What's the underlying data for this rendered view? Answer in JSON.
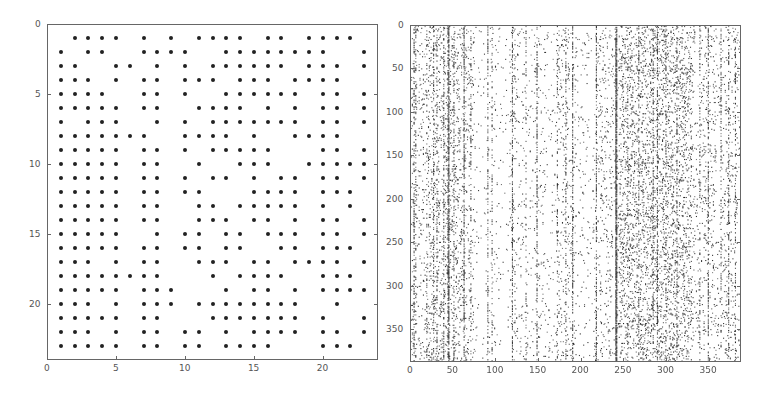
{
  "chart_data": [
    {
      "type": "scatter",
      "subtype": "spy / sparsity pattern",
      "title": "",
      "xlabel": "",
      "ylabel": "",
      "xlim": [
        0,
        24
      ],
      "ylim": [
        24,
        0
      ],
      "y_reversed": true,
      "grid": false,
      "x_ticks": [
        0,
        5,
        10,
        15,
        20
      ],
      "y_ticks": [
        0,
        5,
        10,
        15,
        20
      ],
      "marker": "dot",
      "rows": {
        "1": [
          2,
          3,
          4,
          5,
          7,
          9,
          11,
          12,
          13,
          14,
          16,
          17,
          19,
          20,
          21,
          22
        ],
        "2": [
          1,
          3,
          4,
          7,
          8,
          9,
          10,
          13,
          14,
          15,
          16,
          17,
          18,
          19,
          20,
          23
        ],
        "3": [
          1,
          2,
          5,
          6,
          8,
          10,
          12,
          13,
          14,
          15,
          16,
          17,
          19,
          20,
          21,
          23
        ],
        "4": [
          1,
          2,
          3,
          5,
          7,
          8,
          10,
          11,
          12,
          14,
          15,
          16,
          18,
          19,
          20,
          21
        ],
        "5": [
          1,
          2,
          3,
          4,
          7,
          8,
          10,
          13,
          14,
          15,
          16,
          17,
          18,
          20,
          21,
          23
        ],
        "6": [
          1,
          2,
          3,
          4,
          5,
          7,
          8,
          11,
          12,
          13,
          14,
          16,
          18,
          20,
          21,
          23
        ],
        "7": [
          1,
          3,
          4,
          5,
          8,
          10,
          12,
          13,
          14,
          15,
          16,
          17,
          18,
          20,
          21,
          23
        ],
        "8": [
          1,
          2,
          3,
          4,
          5,
          6,
          7,
          10,
          11,
          12,
          13,
          15,
          18,
          19,
          20,
          21
        ],
        "9": [
          1,
          2,
          3,
          4,
          5,
          7,
          8,
          10,
          12,
          13,
          14,
          15,
          16,
          20,
          21,
          23
        ],
        "10": [
          1,
          2,
          3,
          4,
          5,
          7,
          8,
          11,
          14,
          15,
          16,
          19,
          20,
          21,
          22,
          23
        ],
        "11": [
          1,
          2,
          3,
          4,
          5,
          7,
          8,
          10,
          12,
          13,
          15,
          17,
          18,
          20,
          21,
          23
        ],
        "12": [
          1,
          2,
          3,
          4,
          5,
          7,
          8,
          10,
          11,
          15,
          16,
          17,
          18,
          20,
          21,
          22
        ],
        "13": [
          1,
          2,
          3,
          4,
          5,
          7,
          8,
          11,
          12,
          14,
          15,
          16,
          17,
          18,
          20,
          22
        ],
        "14": [
          1,
          2,
          3,
          4,
          5,
          7,
          8,
          11,
          12,
          13,
          15,
          16,
          18,
          20,
          21,
          23
        ],
        "15": [
          1,
          2,
          3,
          4,
          5,
          8,
          10,
          11,
          13,
          14,
          16,
          17,
          18,
          20,
          21,
          23
        ],
        "16": [
          1,
          2,
          3,
          4,
          5,
          7,
          8,
          10,
          11,
          13,
          14,
          17,
          18,
          20,
          21,
          22
        ],
        "17": [
          1,
          2,
          3,
          5,
          7,
          8,
          11,
          12,
          13,
          15,
          16,
          18,
          19,
          20,
          21,
          23
        ],
        "18": [
          1,
          2,
          3,
          4,
          5,
          6,
          7,
          8,
          12,
          14,
          15,
          16,
          17,
          20,
          21,
          22
        ],
        "19": [
          1,
          2,
          3,
          4,
          5,
          7,
          8,
          9,
          13,
          15,
          16,
          18,
          20,
          21,
          22,
          23
        ],
        "20": [
          1,
          2,
          3,
          5,
          7,
          8,
          9,
          11,
          12,
          13,
          14,
          15,
          16,
          17,
          18,
          21
        ],
        "21": [
          1,
          2,
          3,
          4,
          5,
          7,
          8,
          12,
          13,
          14,
          15,
          16,
          17,
          18,
          20,
          23
        ],
        "22": [
          1,
          2,
          3,
          5,
          7,
          8,
          10,
          11,
          13,
          15,
          16,
          17,
          18,
          20,
          21,
          23
        ],
        "23": [
          1,
          2,
          3,
          4,
          5,
          7,
          8,
          10,
          11,
          13,
          14,
          15,
          16,
          20,
          21,
          22
        ]
      }
    },
    {
      "type": "scatter",
      "subtype": "spy / sparsity pattern (dense, approximate)",
      "title": "",
      "xlabel": "",
      "ylabel": "",
      "xlim": [
        0,
        388
      ],
      "ylim": [
        388,
        0
      ],
      "y_reversed": true,
      "grid": false,
      "x_ticks": [
        0,
        50,
        100,
        150,
        200,
        250,
        300,
        350
      ],
      "y_ticks": [
        0,
        50,
        100,
        150,
        200,
        250,
        300,
        350
      ],
      "size": [
        388,
        388
      ],
      "background_density": 0.035,
      "dense_columns": [
        {
          "col": 3,
          "density": 0.35
        },
        {
          "col": 5,
          "density": 0.25
        },
        {
          "col": 18,
          "density": 0.2
        },
        {
          "col": 26,
          "density": 0.3
        },
        {
          "col": 30,
          "density": 0.3
        },
        {
          "col": 38,
          "density": 0.3
        },
        {
          "col": 43,
          "density": 0.5
        },
        {
          "col": 44,
          "density": 0.75
        },
        {
          "col": 50,
          "density": 0.3
        },
        {
          "col": 62,
          "density": 0.55
        },
        {
          "col": 70,
          "density": 0.25
        },
        {
          "col": 90,
          "density": 0.3
        },
        {
          "col": 95,
          "density": 0.2
        },
        {
          "col": 119,
          "density": 0.5
        },
        {
          "col": 135,
          "density": 0.2
        },
        {
          "col": 148,
          "density": 0.45
        },
        {
          "col": 172,
          "density": 0.2
        },
        {
          "col": 182,
          "density": 0.3
        },
        {
          "col": 190,
          "density": 0.45
        },
        {
          "col": 218,
          "density": 0.4
        },
        {
          "col": 241,
          "density": 0.85
        },
        {
          "col": 242,
          "density": 0.7
        },
        {
          "col": 255,
          "density": 0.25
        },
        {
          "col": 268,
          "density": 0.3
        },
        {
          "col": 285,
          "density": 0.35
        },
        {
          "col": 290,
          "density": 0.45
        },
        {
          "col": 300,
          "density": 0.3
        },
        {
          "col": 313,
          "density": 0.3
        },
        {
          "col": 340,
          "density": 0.25
        },
        {
          "col": 350,
          "density": 0.45
        },
        {
          "col": 365,
          "density": 0.25
        },
        {
          "col": 374,
          "density": 0.35
        },
        {
          "col": 382,
          "density": 0.3
        }
      ],
      "sparse_bands": [
        {
          "from": 75,
          "to": 115,
          "density": 0.012
        },
        {
          "from": 125,
          "to": 170,
          "density": 0.02
        },
        {
          "from": 195,
          "to": 215,
          "density": 0.015
        }
      ],
      "dense_bands": [
        {
          "from": 245,
          "to": 330,
          "density": 0.09
        },
        {
          "from": 20,
          "to": 65,
          "density": 0.06
        }
      ]
    }
  ],
  "colors": {
    "marker": "#222222",
    "frame": "#666666",
    "tick_text": "#555555"
  }
}
